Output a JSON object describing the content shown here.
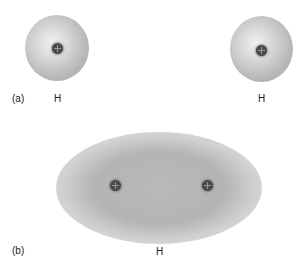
{
  "panel_a": {
    "label": "(a)",
    "atoms": [
      {
        "symbol": "H",
        "nucleus_sign": "+"
      },
      {
        "symbol": "H",
        "nucleus_sign": "+"
      }
    ]
  },
  "panel_b": {
    "label": "(b)",
    "molecule_label": "H",
    "nuclei": [
      "+",
      "+"
    ]
  }
}
